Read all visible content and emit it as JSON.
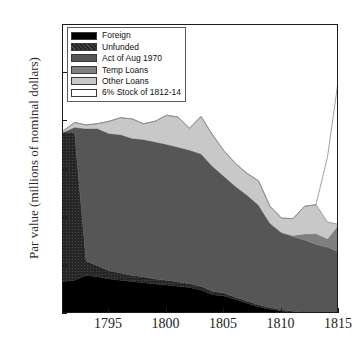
{
  "chart_data": {
    "type": "area",
    "stacked": true,
    "title": "",
    "xlabel": "",
    "ylabel": "Par value (millions of nominal dollars)",
    "xlim": [
      1791,
      1815
    ],
    "ylim": [
      0,
      120
    ],
    "xticks": [
      1795,
      1800,
      1805,
      1810,
      1815
    ],
    "yticks": [
      0,
      20,
      40,
      60,
      80,
      100,
      120
    ],
    "grid": false,
    "legend_position": "upper-left",
    "x": [
      1791,
      1792,
      1793,
      1794,
      1795,
      1796,
      1797,
      1798,
      1799,
      1800,
      1801,
      1802,
      1803,
      1804,
      1805,
      1806,
      1807,
      1808,
      1809,
      1810,
      1811,
      1812,
      1813,
      1814,
      1815
    ],
    "series": [
      {
        "name": "Foreign",
        "color": "#000000",
        "values": [
          13.5,
          14.0,
          16.0,
          15.5,
          14.5,
          14.0,
          13.5,
          13.0,
          12.5,
          12.0,
          11.5,
          11.0,
          10.0,
          8.0,
          7.5,
          6.0,
          4.5,
          3.0,
          2.0,
          1.2,
          0.6,
          0.3,
          0.1,
          0.0,
          0.0
        ]
      },
      {
        "name": "Unfunded",
        "color": "#262626",
        "values": [
          62.0,
          61.5,
          6.0,
          4.5,
          3.5,
          3.0,
          2.5,
          2.5,
          2.0,
          2.0,
          1.8,
          1.6,
          1.5,
          1.4,
          1.2,
          1.0,
          0.9,
          0.8,
          0.7,
          0.6,
          0.5,
          0.4,
          0.3,
          0.2,
          0.2
        ]
      },
      {
        "name": "Act of Aug 1970",
        "color": "#565656",
        "values": [
          0.0,
          2.0,
          55.0,
          57.0,
          57.0,
          57.5,
          57.0,
          57.0,
          57.0,
          56.5,
          56.0,
          55.5,
          55.0,
          52.0,
          48.5,
          46.0,
          44.0,
          41.5,
          35.0,
          32.0,
          31.0,
          30.0,
          28.5,
          27.5,
          25.5
        ]
      },
      {
        "name": "Temp Loans",
        "color": "#7f7f7f",
        "values": [
          0.0,
          0.0,
          0.0,
          0.0,
          0.0,
          0.0,
          0.0,
          0.0,
          0.0,
          0.0,
          0.0,
          0.0,
          0.0,
          0.0,
          0.0,
          0.0,
          0.0,
          0.0,
          0.0,
          0.0,
          0.5,
          2.5,
          4.5,
          3.5,
          11.5
        ]
      },
      {
        "name": "Other Loans",
        "color": "#c8c8c8",
        "values": [
          0.5,
          2.0,
          1.5,
          2.0,
          5.0,
          7.0,
          8.0,
          6.5,
          8.5,
          12.0,
          12.5,
          9.0,
          15.5,
          13.0,
          10.5,
          9.5,
          9.0,
          10.0,
          7.0,
          6.0,
          7.0,
          11.5,
          12.0,
          7.0,
          0.0
        ]
      },
      {
        "name": "6% Stock of 1812-14",
        "color": "#ffffff",
        "values": [
          0.0,
          0.0,
          0.0,
          0.0,
          0.0,
          0.0,
          0.0,
          0.0,
          0.0,
          0.0,
          0.0,
          0.0,
          0.0,
          0.0,
          0.0,
          0.0,
          0.0,
          0.0,
          0.0,
          0.0,
          0.0,
          0.0,
          0.0,
          27.0,
          62.0
        ]
      }
    ]
  },
  "legend": {
    "entries": [
      {
        "label": "Foreign",
        "color": "#000000"
      },
      {
        "label": "Unfunded",
        "color": "#262626"
      },
      {
        "label": "Act of Aug 1970",
        "color": "#565656"
      },
      {
        "label": "Temp Loans",
        "color": "#7f7f7f"
      },
      {
        "label": "Other Loans",
        "color": "#c8c8c8"
      },
      {
        "label": "6% Stock of 1812-14",
        "color": "#ffffff"
      }
    ]
  },
  "axes": {
    "y_title": "Par value (millions of nominal dollars)",
    "ytick_labels": [
      "0",
      "20",
      "40",
      "60",
      "80",
      "100",
      "120"
    ],
    "xtick_labels": [
      "1795",
      "1800",
      "1805",
      "1810",
      "1815"
    ]
  }
}
